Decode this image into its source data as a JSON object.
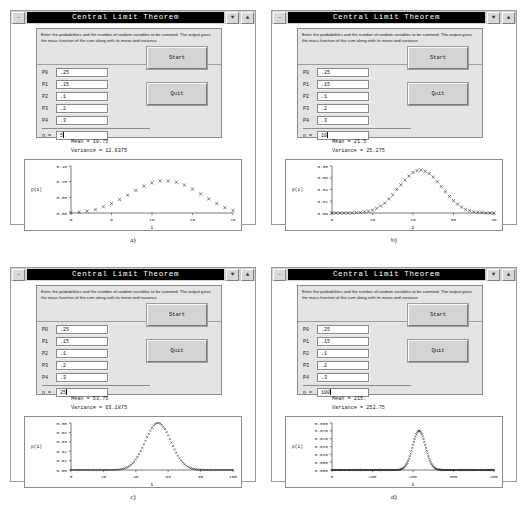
{
  "window": {
    "title": "Central Limit Theorem",
    "minimize_glyph": "–",
    "lower_glyph": "▼",
    "raise_glyph": "▲"
  },
  "form": {
    "instructions": "Enter the probabilities and the number of random variables to be summed. The output gives the mass function of the sum along with its mean and variance.",
    "prob_labels": [
      "P0",
      "P1",
      "P2",
      "P3",
      "P4"
    ],
    "prob_values": [
      ".25",
      ".15",
      ".1",
      ".2",
      ".3"
    ],
    "n_label": "n =",
    "start_label": "Start",
    "quit_label": "Quit"
  },
  "panels": [
    {
      "id": "a",
      "caption": "a)",
      "n": "5",
      "mean_text": "Mean = 10.75",
      "variance_text": "Variance = 12.6375",
      "chart_data": {
        "type": "scatter",
        "title": "",
        "xlabel": "i",
        "ylabel": "p(i)",
        "xlim": [
          0,
          20
        ],
        "ylim": [
          0,
          0.15
        ],
        "xticks": [
          0,
          5,
          10,
          15,
          20
        ],
        "xticklabels": [
          "0",
          "5",
          "10",
          "15",
          "20"
        ],
        "yticks": [
          0.0,
          0.05,
          0.1,
          0.15
        ],
        "yticklabels": [
          "0.00",
          "0.05",
          "0.10",
          "0.15"
        ],
        "grid": false,
        "marker": "x",
        "x": [
          0,
          1,
          2,
          3,
          4,
          5,
          6,
          7,
          8,
          9,
          10,
          11,
          12,
          13,
          14,
          15,
          16,
          17,
          18,
          19,
          20
        ],
        "y": [
          0.001,
          0.003,
          0.006,
          0.011,
          0.02,
          0.03,
          0.043,
          0.057,
          0.072,
          0.086,
          0.096,
          0.102,
          0.102,
          0.098,
          0.089,
          0.076,
          0.061,
          0.045,
          0.03,
          0.017,
          0.008
        ]
      }
    },
    {
      "id": "b",
      "caption": "b)",
      "n": "10",
      "mean_text": "Mean = 21.5",
      "variance_text": "Variance = 25.275",
      "chart_data": {
        "type": "scatter",
        "title": "",
        "xlabel": "i",
        "ylabel": "p(i)",
        "xlim": [
          0,
          40
        ],
        "ylim": [
          0,
          0.08
        ],
        "xticks": [
          0,
          10,
          20,
          30,
          40
        ],
        "xticklabels": [
          "0",
          "10",
          "20",
          "30",
          "40"
        ],
        "yticks": [
          0.0,
          0.02,
          0.04,
          0.06,
          0.08
        ],
        "yticklabels": [
          "0.00",
          "0.02",
          "0.04",
          "0.06",
          "0.08"
        ],
        "grid": false,
        "marker": "x",
        "x": [
          0,
          1,
          2,
          3,
          4,
          5,
          6,
          7,
          8,
          9,
          10,
          11,
          12,
          13,
          14,
          15,
          16,
          17,
          18,
          19,
          20,
          21,
          22,
          23,
          24,
          25,
          26,
          27,
          28,
          29,
          30,
          31,
          32,
          33,
          34,
          35,
          36,
          37,
          38,
          39,
          40
        ],
        "y": [
          0.0,
          0.0,
          0.0,
          0.0,
          0.0,
          0.0,
          0.001,
          0.001,
          0.002,
          0.003,
          0.005,
          0.008,
          0.012,
          0.017,
          0.024,
          0.031,
          0.04,
          0.048,
          0.056,
          0.063,
          0.069,
          0.072,
          0.073,
          0.071,
          0.067,
          0.061,
          0.053,
          0.045,
          0.036,
          0.028,
          0.021,
          0.015,
          0.01,
          0.006,
          0.004,
          0.002,
          0.001,
          0.001,
          0.0,
          0.0,
          0.0
        ]
      }
    },
    {
      "id": "c",
      "caption": "c)",
      "n": "25",
      "mean_text": "Mean = 53.75",
      "variance_text": "Variance = 63.1875",
      "chart_data": {
        "type": "scatter",
        "title": "",
        "xlabel": "i",
        "ylabel": "p(i)",
        "xlim": [
          0,
          100
        ],
        "ylim": [
          0,
          0.05
        ],
        "xticks": [
          0,
          20,
          40,
          60,
          80,
          100
        ],
        "xticklabels": [
          "0",
          "20",
          "40",
          "60",
          "80",
          "100"
        ],
        "yticks": [
          0.0,
          0.01,
          0.02,
          0.03,
          0.04,
          0.05
        ],
        "yticklabels": [
          "0.00",
          "0.01",
          "0.02",
          "0.03",
          "0.04",
          "0.05"
        ],
        "grid": false,
        "marker": "x",
        "gaussian": {
          "mean": 53.75,
          "sd": 7.949,
          "peak": 0.0501,
          "n_points": 101
        }
      }
    },
    {
      "id": "d",
      "caption": "d)",
      "n": "100",
      "mean_text": "Mean = 215.",
      "variance_text": "Variance = 252.75",
      "chart_data": {
        "type": "scatter",
        "title": "",
        "xlabel": "i",
        "ylabel": "p(i)",
        "xlim": [
          0,
          400
        ],
        "ylim": [
          0,
          0.03
        ],
        "xticks": [
          0,
          100,
          200,
          300,
          400
        ],
        "xticklabels": [
          "0",
          "100",
          "200",
          "300",
          "400"
        ],
        "yticks": [
          0.0,
          0.005,
          0.01,
          0.015,
          0.02,
          0.025,
          0.03
        ],
        "yticklabels": [
          "0.000",
          "0.005",
          "0.010",
          "0.015",
          "0.020",
          "0.025",
          "0.030"
        ],
        "grid": false,
        "marker": "x",
        "gaussian": {
          "mean": 215,
          "sd": 15.898,
          "peak": 0.0251,
          "n_points": 201
        }
      }
    }
  ]
}
